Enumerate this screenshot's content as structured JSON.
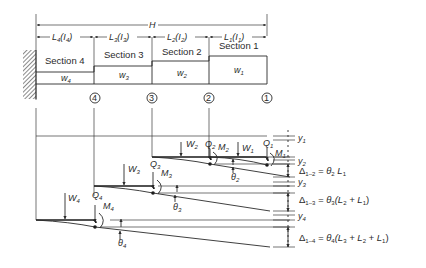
{
  "figure": {
    "type": "stepped-cantilever-deflection-diagram",
    "overall_dimension": {
      "label": "H"
    },
    "spans": [
      {
        "id": "4",
        "L": "L",
        "L_sub": "4",
        "I": "I",
        "I_sub": "4"
      },
      {
        "id": "3",
        "L": "L",
        "L_sub": "3",
        "I": "I",
        "I_sub": "3"
      },
      {
        "id": "2",
        "L": "L",
        "L_sub": "2",
        "I": "I",
        "I_sub": "2"
      },
      {
        "id": "1",
        "L": "L",
        "L_sub": "1",
        "I": "I",
        "I_sub": "1"
      }
    ],
    "sections": [
      {
        "label": "Section 4",
        "w": "w",
        "w_sub": "4"
      },
      {
        "label": "Section 3",
        "w": "w",
        "w_sub": "3"
      },
      {
        "label": "Section 2",
        "w": "w",
        "w_sub": "2"
      },
      {
        "label": "Section 1",
        "w": "w",
        "w_sub": "1"
      }
    ],
    "nodes": [
      "4",
      "3",
      "2",
      "1"
    ],
    "loads": [
      {
        "W": "W",
        "W_sub": "1",
        "Q": "Q",
        "Q_sub": "1",
        "M": "M",
        "M_sub": "1"
      },
      {
        "W": "W",
        "W_sub": "2",
        "Q": "Q",
        "Q_sub": "2",
        "M": "M",
        "M_sub": "2",
        "theta": "θ",
        "theta_sub": "2"
      },
      {
        "W": "W",
        "W_sub": "3",
        "Q": "Q",
        "Q_sub": "3",
        "M": "M",
        "M_sub": "3",
        "theta": "θ",
        "theta_sub": "3"
      },
      {
        "W": "W",
        "W_sub": "4",
        "Q": "Q",
        "Q_sub": "4",
        "M": "M",
        "M_sub": "4",
        "theta": "θ",
        "theta_sub": "4"
      }
    ],
    "deflections": [
      {
        "y": "y",
        "y_sub": "1"
      },
      {
        "y": "y",
        "y_sub": "2"
      },
      {
        "y": "y",
        "y_sub": "3"
      },
      {
        "y": "y",
        "y_sub": "4"
      }
    ],
    "equations": [
      {
        "lhs": "Δ",
        "lhs_sub": "1–2",
        "rhs_prefix": "= θ",
        "rhs_sub": "2",
        "rhs_body": " L",
        "rhs_body_sub": "1",
        "rhs_tail": ""
      },
      {
        "lhs": "Δ",
        "lhs_sub": "1–3",
        "rhs_prefix": "= θ",
        "rhs_sub": "3",
        "rhs_body": "(L",
        "rhs_body_sub": "2",
        "rhs_tail": " + L",
        "rhs_tail_sub": "1",
        "rhs_close": ")"
      },
      {
        "lhs": "Δ",
        "lhs_sub": "1–4",
        "rhs_prefix": "= θ",
        "rhs_sub": "4",
        "rhs_body": "(L",
        "rhs_body_sub": "3",
        "rhs_tail": " + L",
        "rhs_tail_sub": "2",
        "rhs_tail2": " + L",
        "rhs_tail2_sub": "1",
        "rhs_close": ")"
      }
    ]
  }
}
